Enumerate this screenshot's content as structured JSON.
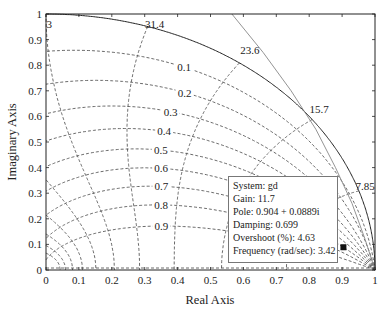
{
  "chart_data": {
    "type": "line",
    "title": "",
    "subtitle": "Discrete-time root locus with z-plane damping/frequency grid",
    "xlabel": "Real Axis",
    "ylabel": "Imaginary Axis",
    "xlim": [
      0,
      1
    ],
    "ylim": [
      0,
      1
    ],
    "x_ticks": [
      "0",
      "0.1",
      "0.2",
      "0.3",
      "0.4",
      "0.5",
      "0.6",
      "0.7",
      "0.8",
      "0.9",
      "1"
    ],
    "y_ticks": [
      "0",
      "0.1",
      "0.2",
      "0.3",
      "0.4",
      "0.5",
      "0.6",
      "0.7",
      "0.8",
      "0.9",
      "1"
    ],
    "grid": true,
    "grid_type": "zgrid",
    "sample_time": 0.1,
    "damping_lines": [
      0.1,
      0.2,
      0.3,
      0.4,
      0.5,
      0.6,
      0.7,
      0.8,
      0.9
    ],
    "damping_labels": [
      "0.1",
      "0.2",
      "0.3",
      "0.4",
      "0.5",
      "0.6",
      "0.7",
      "0.8",
      "0.9"
    ],
    "frequency_lines_fraction_of_nyquist": [
      0.1,
      0.2,
      0.3,
      0.4,
      0.5,
      0.6,
      0.7,
      0.8,
      0.9,
      1.0
    ],
    "frequency_labels": [
      {
        "text": "31.4",
        "x": 0.33,
        "y": 0.96
      },
      {
        "text": "23.6",
        "x": 0.62,
        "y": 0.86
      },
      {
        "text": "15.7",
        "x": 0.83,
        "y": 0.63
      },
      {
        "text": "7.85",
        "x": 0.97,
        "y": 0.33
      },
      {
        "text": "3",
        "x": 0.01,
        "y": 0.96
      }
    ],
    "series": [
      {
        "name": "unit circle",
        "style": "solid",
        "description": "unit circle arc |z|=1"
      },
      {
        "name": "root locus gd",
        "style": "solid",
        "description": "locus branch from (0.57,1.0) curving to (1,0)",
        "points": [
          [
            0.565,
            1.0
          ],
          [
            0.66,
            0.85
          ],
          [
            0.745,
            0.7
          ],
          [
            0.82,
            0.55
          ],
          [
            0.88,
            0.4
          ],
          [
            0.93,
            0.26
          ],
          [
            0.97,
            0.12
          ],
          [
            1.0,
            0.0
          ]
        ]
      }
    ],
    "marker": {
      "x": 0.904,
      "y": 0.0889,
      "shape": "square"
    },
    "datatip": {
      "system": "gd",
      "gain": 11.7,
      "pole": "0.904 + 0.0889i",
      "damping": 0.699,
      "overshoot_pct": 4.63,
      "frequency_rad_s": 3.42
    }
  },
  "axes": {
    "xlabel": "Real Axis",
    "ylabel": "Imaginary Axis"
  },
  "datatip": {
    "line1": "System: gd",
    "line2": "Gain: 11.7",
    "line3": "Pole: 0.904 + 0.0889i",
    "line4": "Damping: 0.699",
    "line5": "Overshoot (%): 4.63",
    "line6": "Frequency (rad/sec): 3.42"
  },
  "colors": {
    "grid": "#444444",
    "locus": "#888888",
    "circle": "#222222",
    "axis": "#222222"
  }
}
